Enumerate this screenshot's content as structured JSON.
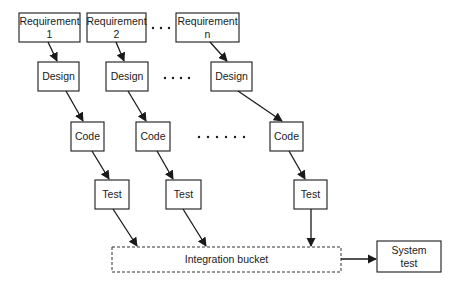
{
  "diagram": {
    "colors": {
      "stroke": "#1a1a1a",
      "background": "#ffffff"
    },
    "requirements": [
      {
        "line1": "Requirement",
        "line2": "1"
      },
      {
        "line1": "Requirement",
        "line2": "2"
      },
      {
        "line1": "Requirement",
        "line2": "n"
      }
    ],
    "design": [
      "Design",
      "Design",
      "Design"
    ],
    "code": [
      "Code",
      "Code",
      "Code"
    ],
    "test": [
      "Test",
      "Test",
      "Test"
    ],
    "integration": "Integration bucket",
    "system_test": {
      "line1": "System",
      "line2": "test"
    },
    "ellipses": {
      "requirements_row": 3,
      "design_row": 4,
      "code_row": 6
    }
  }
}
